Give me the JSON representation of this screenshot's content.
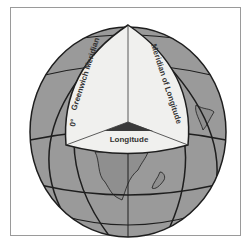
{
  "diagram": {
    "labels": {
      "prime_meridian_degree": "0°",
      "prime_meridian": "Greenwich Meridian",
      "meridian": "Meridian of Longitude",
      "angle": "Longitude"
    },
    "colors": {
      "globe_fill": "#9a9a9a",
      "cutaway_fill": "#f0f0ee",
      "angle_wedge": "#3a3a3a",
      "grid_lines": "#1e1e1e",
      "frame": "#9a9a9a"
    }
  }
}
